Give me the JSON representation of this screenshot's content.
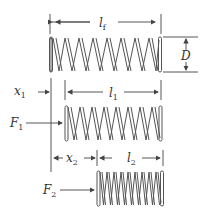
{
  "diagram": {
    "type": "spring-compression-schematic",
    "springs": [
      {
        "id": "free",
        "label": "free length",
        "coils": 8
      },
      {
        "id": "preload",
        "label": "preloaded",
        "coils": 8
      },
      {
        "id": "loaded",
        "label": "fully loaded",
        "coils": 9
      }
    ],
    "labels": {
      "lf_main": "l",
      "lf_sub": "f",
      "D": "D",
      "x1_main": "x",
      "x1_sub": "1",
      "l1_main": "l",
      "l1_sub": "1",
      "F1_main": "F",
      "F1_sub": "1",
      "x2_main": "x",
      "x2_sub": "2",
      "l2_main": "l",
      "l2_sub": "2",
      "F2_main": "F",
      "F2_sub": "2"
    },
    "colors": {
      "line": "#444444",
      "background": "#ffffff"
    }
  }
}
